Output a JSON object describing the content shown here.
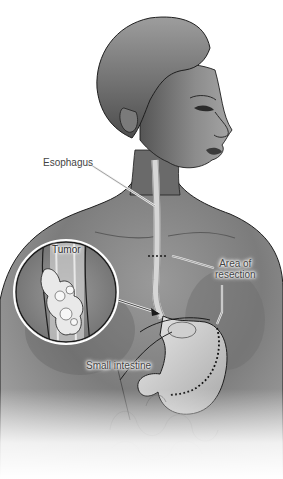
{
  "figure": {
    "labels": {
      "esophagus": "Esophagus",
      "tumor": "Tumor",
      "resection_line1": "Area of",
      "resection_line2": "resection",
      "small_intestine": "Small intestine"
    },
    "colors": {
      "skin_dark": "#5a5a5a",
      "skin_mid": "#8a8a8a",
      "skin_light": "#b5b5b5",
      "organ_light": "#d8d8d8",
      "outline": "#1e1e1e",
      "background": "#ffffff"
    }
  }
}
